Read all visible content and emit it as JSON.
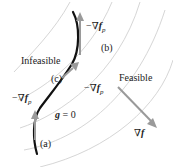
{
  "diagram": {
    "regions": {
      "infeasible": "Infeasible",
      "feasible": "Feasible"
    },
    "constraint_label": {
      "bold": "g",
      "rest": " = 0"
    },
    "points": {
      "a": "(a)",
      "b": "(b)",
      "c": "(c)"
    },
    "gradients": {
      "neg_grad_fp_prefix": "−∇",
      "fp_symbol": "f",
      "fp_sub": "p",
      "grad_f_prefix": "∇",
      "f_symbol": "f"
    },
    "colors": {
      "contour": "#d6d6d6",
      "constraint": "#111111",
      "arrow": "#9a9a9a",
      "text": "#222222"
    }
  }
}
